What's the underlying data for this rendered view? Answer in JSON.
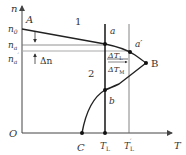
{
  "diagram": {
    "axes": {
      "y_label": "n",
      "x_label": "T",
      "origin_label": "O"
    },
    "y_ticks": {
      "n0": "n",
      "n0_sub": "0",
      "na": "n",
      "na_sub": "a",
      "na_prime": "n",
      "na_prime_sub": "a",
      "na_prime_sup": "′"
    },
    "x_ticks": {
      "TL": "T",
      "TL_sub": "L",
      "TL_prime": "T",
      "TL_prime_sub": "L",
      "TL_prime_sup": "′"
    },
    "points": {
      "A": "A",
      "a": "a",
      "a_prime": "a′",
      "B": "B",
      "b": "b",
      "C": "C"
    },
    "regions": {
      "region1": "1",
      "region2": "2"
    },
    "annotations": {
      "delta_n": "Δn",
      "delta_TL": "ΔT",
      "delta_TL_sub": "L",
      "delta_TM": "ΔT",
      "delta_TM_sub": "M"
    },
    "colors": {
      "line": "#222222",
      "axis": "#444444",
      "thin_line": "#666666",
      "guide": "#999999"
    }
  }
}
